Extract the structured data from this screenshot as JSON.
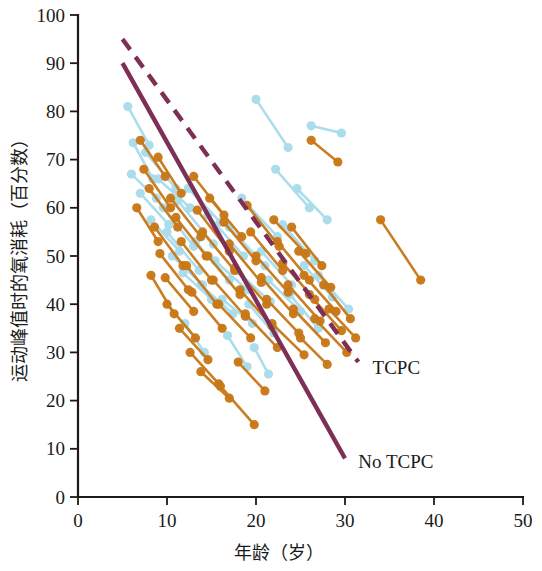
{
  "chart_data": {
    "type": "scatter",
    "title": "",
    "subtitle": "",
    "xlabel": "年龄（岁）",
    "ylabel": "运动峰值时的氧消耗（百分数）",
    "xlim": [
      0,
      50
    ],
    "ylim": [
      0,
      100
    ],
    "xticks": [
      0,
      10,
      20,
      30,
      40,
      50
    ],
    "yticks": [
      0,
      10,
      20,
      30,
      40,
      50,
      60,
      70,
      80,
      90,
      100
    ],
    "xtick_labels": [
      "0",
      "10",
      "20",
      "30",
      "40",
      "50"
    ],
    "ytick_labels": [
      "0",
      "10",
      "20",
      "30",
      "40",
      "50",
      "60",
      "70",
      "80",
      "90",
      "100"
    ],
    "grid": false,
    "legend_position": "inline-annotation",
    "colors": {
      "series_no_tcpc": "#C87818",
      "series_tcpc": "#A8DCEB",
      "trend_tcpc": "#7E2F55",
      "trend_no_tcpc": "#7E2F55",
      "axis": "#1a1a1a"
    },
    "annotations": [
      {
        "text": "TCPC",
        "x": 32.2,
        "y": 27.0,
        "style": "dashed-line-label"
      },
      {
        "text": "No TCPC",
        "x": 30.6,
        "y": 7.5,
        "style": "solid-line-label"
      }
    ],
    "series": [
      {
        "name": "TCPC",
        "marker": "circle",
        "color": "#A8DCEB",
        "linestyle": "solid-pair-segment",
        "description": "Paired observations connected by line segments (light blue)",
        "pairs": [
          [
            [
              5.6,
              81.0
            ],
            [
              8.0,
              73.0
            ]
          ],
          [
            [
              6.2,
              73.5
            ],
            [
              8.4,
              66.0
            ]
          ],
          [
            [
              6.0,
              67.0
            ],
            [
              8.8,
              62.0
            ]
          ],
          [
            [
              7.0,
              63.0
            ],
            [
              10.2,
              56.5
            ]
          ],
          [
            [
              7.6,
              71.5
            ],
            [
              11.0,
              64.0
            ]
          ],
          [
            [
              8.2,
              57.5
            ],
            [
              11.4,
              51.0
            ]
          ],
          [
            [
              9.0,
              66.0
            ],
            [
              12.6,
              60.0
            ]
          ],
          [
            [
              9.6,
              60.0
            ],
            [
              13.0,
              52.0
            ]
          ],
          [
            [
              10.0,
              55.0
            ],
            [
              13.6,
              47.0
            ]
          ],
          [
            [
              10.6,
              50.0
            ],
            [
              14.0,
              44.0
            ]
          ],
          [
            [
              11.2,
              61.5
            ],
            [
              15.2,
              52.5
            ]
          ],
          [
            [
              11.8,
              46.5
            ],
            [
              15.0,
              41.0
            ]
          ],
          [
            [
              12.4,
              64.0
            ],
            [
              16.0,
              57.0
            ]
          ],
          [
            [
              13.2,
              53.0
            ],
            [
              17.0,
              45.0
            ]
          ],
          [
            [
              13.8,
              44.0
            ],
            [
              17.4,
              38.0
            ]
          ],
          [
            [
              14.6,
              58.5
            ],
            [
              18.6,
              50.0
            ]
          ],
          [
            [
              15.4,
              49.0
            ],
            [
              19.0,
              43.0
            ]
          ],
          [
            [
              16.2,
              41.0
            ],
            [
              19.6,
              36.0
            ]
          ],
          [
            [
              17.0,
              56.0
            ],
            [
              21.0,
              48.0
            ]
          ],
          [
            [
              17.8,
              47.0
            ],
            [
              21.6,
              40.5
            ]
          ],
          [
            [
              18.4,
              62.0
            ],
            [
              22.4,
              54.0
            ]
          ],
          [
            [
              19.2,
              40.0
            ],
            [
              22.0,
              34.0
            ]
          ],
          [
            [
              20.0,
              82.5
            ],
            [
              23.6,
              72.5
            ]
          ],
          [
            [
              20.6,
              51.0
            ],
            [
              24.0,
              44.0
            ]
          ],
          [
            [
              21.4,
              45.0
            ],
            [
              25.0,
              38.5
            ]
          ],
          [
            [
              22.2,
              68.0
            ],
            [
              26.0,
              60.0
            ]
          ],
          [
            [
              23.0,
              56.5
            ],
            [
              26.6,
              49.0
            ]
          ],
          [
            [
              23.8,
              42.0
            ],
            [
              27.0,
              35.0
            ]
          ],
          [
            [
              24.6,
              64.0
            ],
            [
              28.0,
              57.5
            ]
          ],
          [
            [
              25.4,
              48.0
            ],
            [
              28.6,
              41.5
            ]
          ],
          [
            [
              26.2,
              77.0
            ],
            [
              29.6,
              75.5
            ]
          ],
          [
            [
              27.0,
              46.0
            ],
            [
              30.4,
              39.0
            ]
          ],
          [
            [
              19.8,
              31.0
            ],
            [
              21.4,
              25.5
            ]
          ],
          [
            [
              12.0,
              36.0
            ],
            [
              14.2,
              30.0
            ]
          ],
          [
            [
              16.8,
              33.5
            ],
            [
              19.0,
              27.0
            ]
          ]
        ]
      },
      {
        "name": "No TCPC",
        "marker": "circle",
        "color": "#C87818",
        "linestyle": "solid-pair-segment",
        "description": "Paired observations connected by line segments (orange)",
        "pairs": [
          [
            [
              7.0,
              74.0
            ],
            [
              9.8,
              66.5
            ]
          ],
          [
            [
              7.4,
              68.0
            ],
            [
              10.4,
              60.0
            ]
          ],
          [
            [
              6.6,
              60.0
            ],
            [
              9.0,
              53.0
            ]
          ],
          [
            [
              8.0,
              64.0
            ],
            [
              11.2,
              56.0
            ]
          ],
          [
            [
              8.6,
              56.0
            ],
            [
              11.8,
              48.0
            ]
          ],
          [
            [
              9.2,
              50.5
            ],
            [
              12.4,
              43.0
            ]
          ],
          [
            [
              9.8,
              45.5
            ],
            [
              13.0,
              38.5
            ]
          ],
          [
            [
              10.4,
              62.0
            ],
            [
              13.8,
              54.0
            ]
          ],
          [
            [
              11.0,
              58.0
            ],
            [
              14.4,
              50.0
            ]
          ],
          [
            [
              11.6,
              53.0
            ],
            [
              15.0,
              45.0
            ]
          ],
          [
            [
              12.2,
              48.0
            ],
            [
              15.6,
              40.0
            ]
          ],
          [
            [
              12.8,
              42.5
            ],
            [
              16.2,
              35.0
            ]
          ],
          [
            [
              13.4,
              59.5
            ],
            [
              17.0,
              51.0
            ]
          ],
          [
            [
              14.0,
              55.0
            ],
            [
              17.6,
              47.0
            ]
          ],
          [
            [
              14.6,
              50.0
            ],
            [
              18.2,
              42.0
            ]
          ],
          [
            [
              15.2,
              45.0
            ],
            [
              18.8,
              37.5
            ]
          ],
          [
            [
              15.8,
              40.0
            ],
            [
              19.4,
              33.0
            ]
          ],
          [
            [
              16.4,
              57.0
            ],
            [
              20.0,
              49.0
            ]
          ],
          [
            [
              17.0,
              52.5
            ],
            [
              20.6,
              44.5
            ]
          ],
          [
            [
              17.6,
              47.5
            ],
            [
              21.2,
              40.0
            ]
          ],
          [
            [
              18.2,
              43.0
            ],
            [
              21.8,
              35.5
            ]
          ],
          [
            [
              18.8,
              38.0
            ],
            [
              22.4,
              31.0
            ]
          ],
          [
            [
              19.4,
              55.0
            ],
            [
              23.0,
              47.0
            ]
          ],
          [
            [
              20.0,
              50.0
            ],
            [
              23.6,
              42.5
            ]
          ],
          [
            [
              20.6,
              45.5
            ],
            [
              24.2,
              38.0
            ]
          ],
          [
            [
              21.2,
              41.0
            ],
            [
              24.8,
              34.0
            ]
          ],
          [
            [
              21.8,
              36.0
            ],
            [
              25.4,
              29.5
            ]
          ],
          [
            [
              22.4,
              53.0
            ],
            [
              26.0,
              45.0
            ]
          ],
          [
            [
              23.0,
              48.5
            ],
            [
              26.6,
              41.0
            ]
          ],
          [
            [
              23.6,
              44.0
            ],
            [
              27.2,
              36.5
            ]
          ],
          [
            [
              24.2,
              39.0
            ],
            [
              27.8,
              32.0
            ]
          ],
          [
            [
              24.8,
              51.0
            ],
            [
              28.4,
              43.5
            ]
          ],
          [
            [
              25.4,
              46.0
            ],
            [
              29.0,
              38.5
            ]
          ],
          [
            [
              26.0,
              42.0
            ],
            [
              29.6,
              34.5
            ]
          ],
          [
            [
              26.6,
              37.0
            ],
            [
              30.2,
              30.0
            ]
          ],
          [
            [
              9.0,
              70.5
            ],
            [
              11.6,
              63.0
            ]
          ],
          [
            [
              10.0,
              40.0
            ],
            [
              13.2,
              33.0
            ]
          ],
          [
            [
              11.4,
              35.0
            ],
            [
              14.6,
              28.5
            ]
          ],
          [
            [
              12.6,
              30.0
            ],
            [
              15.8,
              23.5
            ]
          ],
          [
            [
              13.8,
              26.0
            ],
            [
              17.0,
              20.5
            ]
          ],
          [
            [
              16.0,
              23.0
            ],
            [
              19.8,
              15.0
            ]
          ],
          [
            [
              26.2,
              74.0
            ],
            [
              29.2,
              69.5
            ]
          ],
          [
            [
              34.0,
              57.5
            ],
            [
              38.5,
              45.0
            ]
          ],
          [
            [
              27.6,
              44.0
            ],
            [
              30.6,
              37.0
            ]
          ],
          [
            [
              28.2,
              39.0
            ],
            [
              31.2,
              33.0
            ]
          ],
          [
            [
              8.2,
              46.0
            ],
            [
              10.8,
              38.0
            ]
          ],
          [
            [
              18.0,
              28.0
            ],
            [
              21.0,
              22.0
            ]
          ],
          [
            [
              22.0,
              57.5
            ],
            [
              25.6,
              50.5
            ]
          ],
          [
            [
              13.0,
              66.5
            ],
            [
              16.4,
              58.5
            ]
          ],
          [
            [
              14.8,
              62.0
            ],
            [
              18.4,
              54.0
            ]
          ],
          [
            [
              19.0,
              60.5
            ],
            [
              22.6,
              52.0
            ]
          ],
          [
            [
              24.0,
              56.0
            ],
            [
              27.4,
              48.0
            ]
          ],
          [
            [
              25.0,
              33.0
            ],
            [
              28.0,
              27.5
            ]
          ]
        ]
      }
    ],
    "trend_lines": [
      {
        "name": "TCPC",
        "linestyle": "dashed",
        "color": "#7E2F55",
        "x": [
          5.0,
          31.5
        ],
        "y": [
          95.0,
          28.0
        ]
      },
      {
        "name": "No TCPC",
        "linestyle": "solid",
        "color": "#7E2F55",
        "x": [
          5.0,
          30.0
        ],
        "y": [
          90.0,
          8.0
        ]
      }
    ]
  }
}
